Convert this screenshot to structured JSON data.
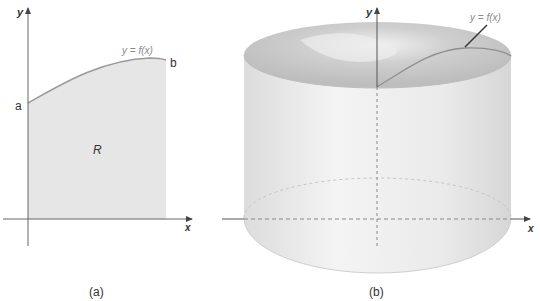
{
  "panel_a": {
    "caption": "(a)",
    "x_axis_label": "x",
    "y_axis_label": "y",
    "curve_label": "y = f(x)",
    "left_endpoint_label": "a",
    "right_endpoint_label": "b",
    "region_label": "R"
  },
  "panel_b": {
    "caption": "(b)",
    "x_axis_label": "x",
    "y_axis_label": "y",
    "curve_label": "y = f(x)"
  },
  "colors": {
    "region_fill": "#e6e6e6",
    "curve": "#9a9a9a",
    "axis": "#555555",
    "cylinder_body": "#ececec",
    "cylinder_top": "#c8c8c8"
  }
}
